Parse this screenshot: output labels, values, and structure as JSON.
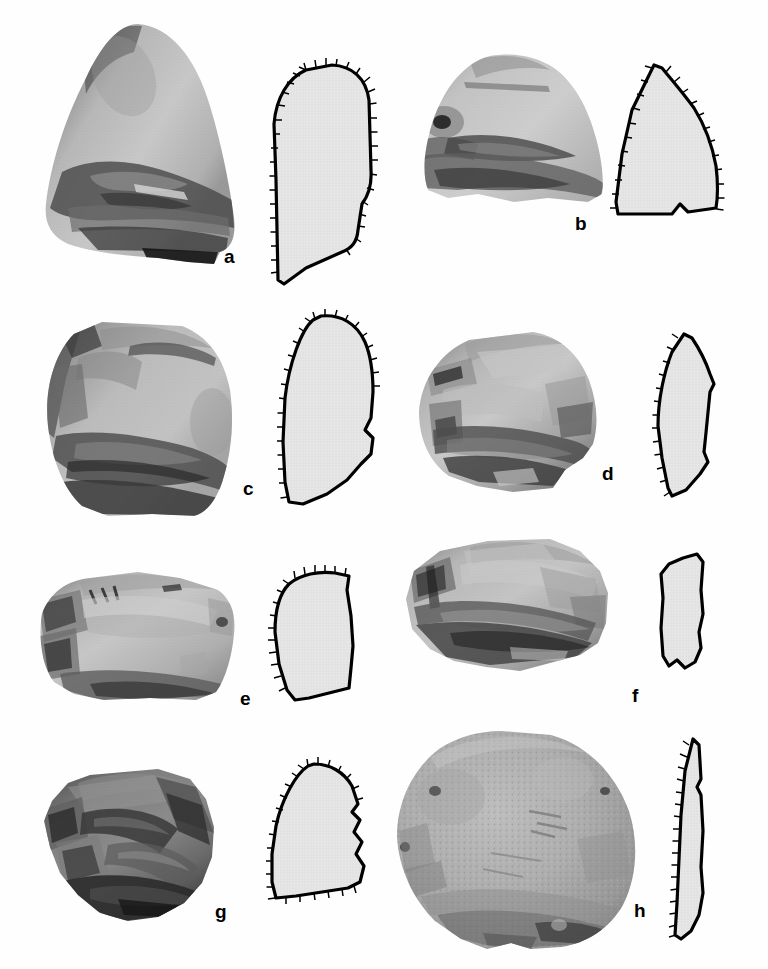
{
  "plate": {
    "background_color": "#fefefe",
    "ink_color": "#000000",
    "outline_fill_color": "#e6e6e6",
    "width": 768,
    "height": 969,
    "medium": "halftone photographic plate with line-drawing cross sections"
  },
  "specimens": [
    {
      "id": "a",
      "label": "a",
      "label_x": 224,
      "label_y": 247,
      "photo": {
        "name": "specimen-photo-a",
        "x": 38,
        "y": 22,
        "width": 202,
        "height": 243,
        "tone": "light gray cortex with dark shadowed flake scars along lower edge",
        "shape": "rounded triangular / domed pebble tool, point up"
      },
      "outline": {
        "name": "specimen-outline-a",
        "x": 272,
        "y": 62,
        "width": 106,
        "height": 226,
        "retouch_edge": "left and upper margins hatched",
        "description": "tall narrow profile, domed top, stepped base"
      }
    },
    {
      "id": "b",
      "label": "b",
      "label_x": 575,
      "label_y": 214,
      "photo": {
        "name": "specimen-photo-b",
        "x": 418,
        "y": 52,
        "width": 190,
        "height": 152,
        "tone": "pale gray upper face, dark gray flaked lower margin",
        "shape": "dome-backed chopping tool"
      },
      "outline": {
        "name": "specimen-outline-b",
        "x": 610,
        "y": 62,
        "width": 110,
        "height": 165,
        "retouch_edge": "left and right margins hatched",
        "description": "triangular wedge profile with notched base"
      }
    },
    {
      "id": "c",
      "label": "c",
      "label_x": 243,
      "label_y": 479,
      "photo": {
        "name": "specimen-photo-c",
        "x": 42,
        "y": 318,
        "width": 195,
        "height": 200,
        "tone": "mid gray with deep dark flake scars at left and bottom",
        "shape": "sub-square core / chopper"
      },
      "outline": {
        "name": "specimen-outline-c",
        "x": 275,
        "y": 312,
        "width": 105,
        "height": 200,
        "retouch_edge": "left margin fully hatched",
        "description": "tall leaf-like profile with stepped right side"
      }
    },
    {
      "id": "d",
      "label": "d",
      "label_x": 602,
      "label_y": 464,
      "photo": {
        "name": "specimen-photo-d",
        "x": 413,
        "y": 330,
        "width": 190,
        "height": 165,
        "tone": "light gray facets with dark shadowed lower flake scars",
        "shape": "sub-rounded discoidal core"
      },
      "outline": {
        "name": "specimen-outline-d",
        "x": 644,
        "y": 330,
        "width": 80,
        "height": 172,
        "retouch_edge": "left margin hatched",
        "description": "narrow biconvex lens / pointed oval profile"
      }
    },
    {
      "id": "e",
      "label": "e",
      "label_x": 240,
      "label_y": 689,
      "photo": {
        "name": "specimen-photo-e",
        "x": 30,
        "y": 570,
        "width": 210,
        "height": 133,
        "tone": "pale gray flat upper facet, dark left and lower edges",
        "shape": "broad flat-topped core with faceted platform"
      },
      "outline": {
        "name": "specimen-outline-e",
        "x": 265,
        "y": 568,
        "width": 95,
        "height": 137,
        "retouch_edge": "left margin and top hatched",
        "description": "rounded-square profile tapering to base"
      }
    },
    {
      "id": "f",
      "label": "f",
      "label_x": 632,
      "label_y": 686,
      "photo": {
        "name": "specimen-photo-f",
        "x": 400,
        "y": 537,
        "width": 212,
        "height": 140,
        "tone": "light gray upper surface with darker chipped lower margin",
        "shape": "low wedge-shaped side chopper"
      },
      "outline": {
        "name": "specimen-outline-f",
        "x": 655,
        "y": 550,
        "width": 57,
        "height": 125,
        "retouch_edge": "no hatching; plain outline",
        "description": "narrow irregular rectangular profile"
      }
    },
    {
      "id": "g",
      "label": "g",
      "label_x": 215,
      "label_y": 902,
      "photo": {
        "name": "specimen-photo-g",
        "x": 38,
        "y": 765,
        "width": 186,
        "height": 160,
        "tone": "dark gray to near black with strong ridged flake scars",
        "shape": "polyhedral multi-faceted core"
      },
      "outline": {
        "name": "specimen-outline-g",
        "x": 262,
        "y": 758,
        "width": 108,
        "height": 148,
        "retouch_edge": "left margin and top hatched",
        "description": "quadrant profile with wavy stepped right edge"
      }
    },
    {
      "id": "h",
      "label": "h",
      "label_x": 634,
      "label_y": 901,
      "photo": {
        "name": "specimen-photo-h",
        "x": 391,
        "y": 727,
        "width": 250,
        "height": 226,
        "tone": "uniform mid gray coarse cortex, pitted surface",
        "shape": "large circular discoid / flat disc core"
      },
      "outline": {
        "name": "specimen-outline-h",
        "x": 663,
        "y": 735,
        "width": 48,
        "height": 210,
        "retouch_edge": "left margin fully hatched",
        "description": "long thin crescent / plano-convex blade profile"
      }
    }
  ]
}
